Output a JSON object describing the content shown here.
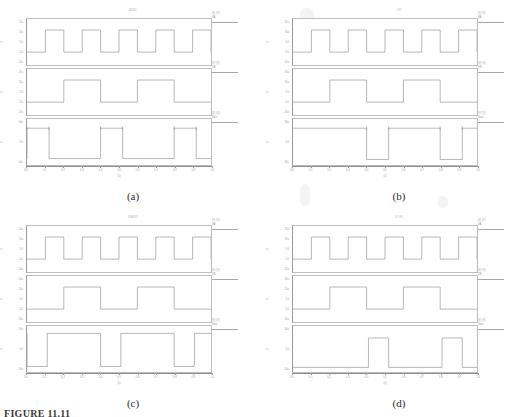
{
  "figure": {
    "caption": "FIGURE 11.11",
    "xtick_labels": [
      "0.0",
      "0.1",
      "0.2",
      "0.3",
      "0.4",
      "0.5",
      "0.6",
      "0.7",
      "0.8",
      "0.9",
      "1.0"
    ],
    "xaxis_name": "(s)",
    "ytick_labels_v": [
      "25u",
      "15u",
      "5.0",
      "-5.0",
      "-15u"
    ],
    "ytick_labels_out": [
      "50u",
      "0.0",
      "-50u"
    ],
    "yaxis_names": [
      "V",
      "V",
      "V"
    ],
    "legend_scale": "(V)",
    "trace_color": "#7d7d7d",
    "axis_color": "#9a9a9a"
  },
  "panels": [
    {
      "id": "a",
      "caption": "(a)",
      "title": "AND",
      "subplots": [
        {
          "name": "input-a",
          "signal_label": "VA",
          "legend_top": "(V) (V)",
          "yticks": [
            "25u",
            "15u",
            "5.0",
            "-5.0",
            "-15u"
          ],
          "yaxis": "V",
          "waveform": {
            "type": "square",
            "cycles": 5,
            "duty": 0.5,
            "start_level": "high",
            "high": 0.72,
            "low": 0.24
          }
        },
        {
          "name": "input-b",
          "signal_label": "VB",
          "legend_top": "(V) (V)",
          "yticks": [
            "25u",
            "15u",
            "5.0",
            "-5.0",
            "-15u"
          ],
          "yaxis": "V",
          "waveform": {
            "type": "square",
            "cycles": 2.5,
            "duty": 0.5,
            "start_level": "high",
            "high": 0.72,
            "low": 0.24
          }
        },
        {
          "name": "output",
          "signal_label": "Vout",
          "legend_top": "(V) (V)",
          "yticks": [
            "50u",
            "0.0",
            "-50u"
          ],
          "yaxis": "V",
          "waveform": {
            "type": "logic-and",
            "high": 0.2,
            "low": 0.86,
            "markers": true,
            "segments": [
              [
                0.0,
                0.12
              ],
              [
                0.4,
                0.52
              ],
              [
                0.8,
                0.92
              ]
            ]
          }
        }
      ]
    },
    {
      "id": "b",
      "caption": "(b)",
      "title": "OR",
      "subplots": [
        {
          "name": "input-a",
          "signal_label": "VA",
          "legend_top": "(V) (V)",
          "yticks": [
            "25u",
            "15u",
            "5.0",
            "-5.0",
            "-15u"
          ],
          "yaxis": "V",
          "waveform": {
            "type": "square",
            "cycles": 5,
            "duty": 0.5,
            "start_level": "high",
            "high": 0.72,
            "low": 0.24
          }
        },
        {
          "name": "input-b",
          "signal_label": "VB",
          "legend_top": "(V) (V)",
          "yticks": [
            "25u",
            "15u",
            "5.0",
            "-5.0",
            "-15u"
          ],
          "yaxis": "V",
          "waveform": {
            "type": "square",
            "cycles": 2.5,
            "duty": 0.5,
            "start_level": "high",
            "high": 0.72,
            "low": 0.24
          }
        },
        {
          "name": "output",
          "signal_label": "Vout",
          "legend_top": "(V) (V)",
          "yticks": [
            "50u",
            "0.0",
            "-50u"
          ],
          "yaxis": "V",
          "waveform": {
            "type": "logic-or",
            "high": 0.2,
            "low": 0.88,
            "markers": true,
            "dips": [
              [
                0.4,
                0.52
              ],
              [
                0.8,
                0.92
              ]
            ]
          }
        }
      ]
    },
    {
      "id": "c",
      "caption": "(c)",
      "title": "NAND",
      "subplots": [
        {
          "name": "input-a",
          "signal_label": "VA",
          "legend_top": "(V) (V)",
          "yticks": [
            "25u",
            "15u",
            "5.0",
            "-5.0",
            "-15u"
          ],
          "yaxis": "V",
          "waveform": {
            "type": "square",
            "cycles": 5,
            "duty": 0.5,
            "start_level": "high",
            "high": 0.72,
            "low": 0.24
          }
        },
        {
          "name": "input-b",
          "signal_label": "VB",
          "legend_top": "(V) (V)",
          "yticks": [
            "25u",
            "15u",
            "5.0",
            "-5.0",
            "-15u"
          ],
          "yaxis": "V",
          "waveform": {
            "type": "square",
            "cycles": 2.5,
            "duty": 0.5,
            "start_level": "high",
            "high": 0.72,
            "low": 0.24
          }
        },
        {
          "name": "output",
          "signal_label": "Vout",
          "legend_top": "(V) (V)",
          "yticks": [
            "50u",
            "0.0",
            "-50u"
          ],
          "yaxis": "V",
          "waveform": {
            "type": "logic-nand",
            "high": 0.16,
            "low": 0.88,
            "markers": false,
            "dips": [
              [
                0.0,
                0.11
              ],
              [
                0.4,
                0.51
              ],
              [
                0.8,
                0.91
              ]
            ]
          }
        }
      ]
    },
    {
      "id": "d",
      "caption": "(d)",
      "title": "XOR",
      "subplots": [
        {
          "name": "input-a",
          "signal_label": "VA",
          "legend_top": "(V) (V)",
          "yticks": [
            "25u",
            "15u",
            "5.0",
            "-5.0",
            "-15u"
          ],
          "yaxis": "V",
          "waveform": {
            "type": "square",
            "cycles": 5,
            "duty": 0.5,
            "start_level": "high",
            "high": 0.72,
            "low": 0.24
          }
        },
        {
          "name": "input-b",
          "signal_label": "VB",
          "legend_top": "(V) (V)",
          "yticks": [
            "25u",
            "15u",
            "5.0",
            "-5.0",
            "-15u"
          ],
          "yaxis": "V",
          "waveform": {
            "type": "square",
            "cycles": 2.5,
            "duty": 0.5,
            "start_level": "high",
            "high": 0.72,
            "low": 0.24
          }
        },
        {
          "name": "output",
          "signal_label": "Vout",
          "legend_top": "(V) (V)",
          "yticks": [
            "50u",
            "0.0",
            "-50u"
          ],
          "yaxis": "V",
          "waveform": {
            "type": "logic-xor",
            "high": 0.26,
            "low": 0.9,
            "markers": false,
            "pulses": [
              [
                0.41,
                0.52
              ],
              [
                0.81,
                0.92
              ]
            ]
          }
        }
      ]
    }
  ],
  "chart_data": {
    "type": "line",
    "xlabel": "(s)",
    "ylabel": "V",
    "xlim": [
      0.0,
      1.0
    ],
    "grid": false,
    "legend": "right",
    "panels": [
      {
        "panel": "(a)",
        "gate": "AND",
        "series": [
          {
            "name": "VA",
            "type": "square",
            "cycles": 5,
            "levels_u": [
              15,
              -5
            ]
          },
          {
            "name": "VB",
            "type": "square",
            "cycles": 2.5,
            "levels_u": [
              15,
              -5
            ]
          },
          {
            "name": "Vout",
            "type": "logic",
            "levels_u": [
              50,
              -50
            ],
            "high_intervals": [
              [
                0.0,
                0.12
              ],
              [
                0.4,
                0.52
              ],
              [
                0.8,
                0.92
              ]
            ]
          }
        ]
      },
      {
        "panel": "(b)",
        "gate": "OR",
        "series": [
          {
            "name": "VA",
            "type": "square",
            "cycles": 5,
            "levels_u": [
              15,
              -5
            ]
          },
          {
            "name": "VB",
            "type": "square",
            "cycles": 2.5,
            "levels_u": [
              15,
              -5
            ]
          },
          {
            "name": "Vout",
            "type": "logic",
            "levels_u": [
              50,
              -50
            ],
            "low_intervals": [
              [
                0.4,
                0.52
              ],
              [
                0.8,
                0.92
              ]
            ]
          }
        ]
      },
      {
        "panel": "(c)",
        "gate": "NAND",
        "series": [
          {
            "name": "VA",
            "type": "square",
            "cycles": 5,
            "levels_u": [
              15,
              -5
            ]
          },
          {
            "name": "VB",
            "type": "square",
            "cycles": 2.5,
            "levels_u": [
              15,
              -5
            ]
          },
          {
            "name": "Vout",
            "type": "logic",
            "levels_u": [
              50,
              -50
            ],
            "low_intervals": [
              [
                0.0,
                0.11
              ],
              [
                0.4,
                0.51
              ],
              [
                0.8,
                0.91
              ]
            ]
          }
        ]
      },
      {
        "panel": "(d)",
        "gate": "XOR",
        "series": [
          {
            "name": "VA",
            "type": "square",
            "cycles": 5,
            "levels_u": [
              15,
              -5
            ]
          },
          {
            "name": "VB",
            "type": "square",
            "cycles": 2.5,
            "levels_u": [
              15,
              -5
            ]
          },
          {
            "name": "Vout",
            "type": "logic",
            "levels_u": [
              50,
              -50
            ],
            "high_intervals": [
              [
                0.41,
                0.52
              ],
              [
                0.81,
                0.92
              ]
            ]
          }
        ]
      }
    ]
  }
}
